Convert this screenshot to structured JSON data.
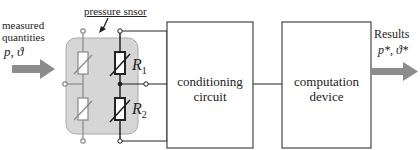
{
  "input": {
    "label_line1": "measured",
    "label_line2": "quantities",
    "variables": "p, ϑ"
  },
  "sensor": {
    "label": "pressure snsor",
    "resistors": [
      {
        "name": "R",
        "sub": "1"
      },
      {
        "name": "R",
        "sub": "2"
      }
    ]
  },
  "blocks": [
    {
      "line1": "conditioning",
      "line2": "circuit"
    },
    {
      "line1": "computation",
      "line2": "device"
    }
  ],
  "output": {
    "label": "Results",
    "variables": "p*, ϑ*"
  },
  "colors": {
    "arrow": "#8c8c8c",
    "sensor_fill": "#d6d6d6",
    "line": "#222222"
  }
}
